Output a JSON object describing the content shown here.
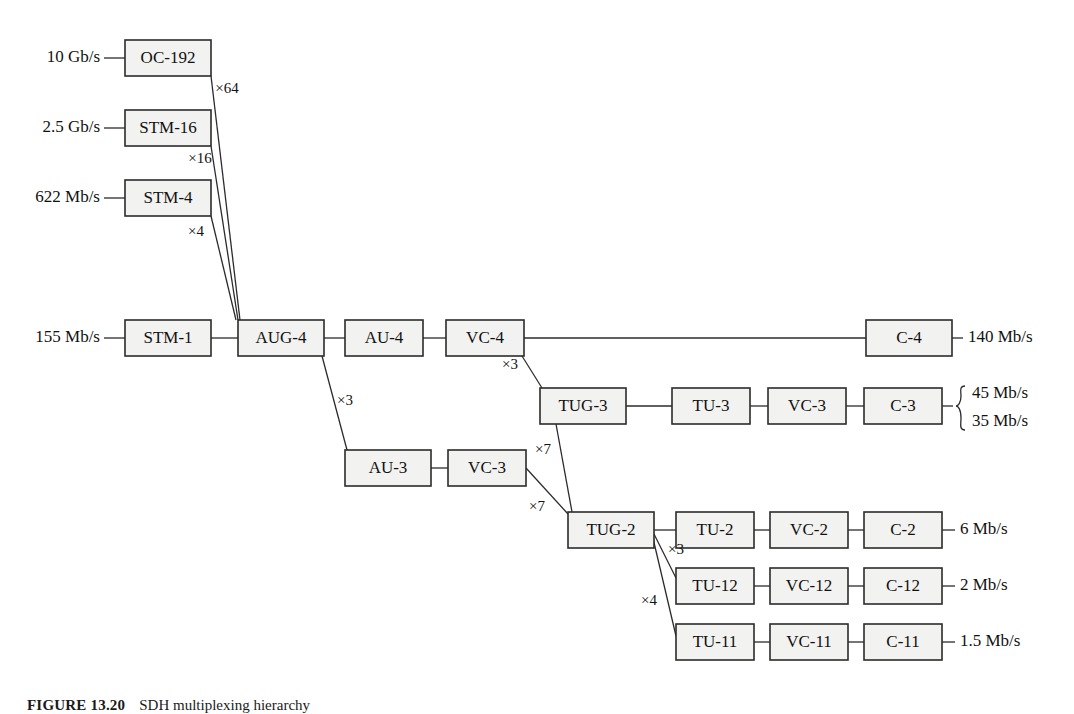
{
  "figure": {
    "caption_label": "FIGURE 13.20",
    "caption_text": "SDH multiplexing hierarchy",
    "box_fill": "#f2f2f0",
    "box_stroke": "#2b2b2b"
  },
  "nodes": {
    "oc192": {
      "label": "OC-192",
      "x": 125,
      "y": 40,
      "w": 86,
      "h": 36
    },
    "stm16": {
      "label": "STM-16",
      "x": 125,
      "y": 110,
      "w": 86,
      "h": 36
    },
    "stm4": {
      "label": "STM-4",
      "x": 125,
      "y": 180,
      "w": 86,
      "h": 36
    },
    "stm1": {
      "label": "STM-1",
      "x": 125,
      "y": 320,
      "w": 86,
      "h": 36
    },
    "aug4": {
      "label": "AUG-4",
      "x": 238,
      "y": 320,
      "w": 86,
      "h": 36
    },
    "au4": {
      "label": "AU-4",
      "x": 345,
      "y": 320,
      "w": 78,
      "h": 36
    },
    "vc4": {
      "label": "VC-4",
      "x": 446,
      "y": 320,
      "w": 78,
      "h": 36
    },
    "c4": {
      "label": "C-4",
      "x": 866,
      "y": 320,
      "w": 86,
      "h": 36
    },
    "tug3": {
      "label": "TUG-3",
      "x": 540,
      "y": 388,
      "w": 86,
      "h": 36
    },
    "tu3": {
      "label": "TU-3",
      "x": 672,
      "y": 388,
      "w": 78,
      "h": 36
    },
    "vc3r": {
      "label": "VC-3",
      "x": 768,
      "y": 388,
      "w": 78,
      "h": 36
    },
    "c3": {
      "label": "C-3",
      "x": 864,
      "y": 388,
      "w": 78,
      "h": 36
    },
    "au3": {
      "label": "AU-3",
      "x": 345,
      "y": 450,
      "w": 86,
      "h": 36
    },
    "vc3l": {
      "label": "VC-3",
      "x": 448,
      "y": 450,
      "w": 78,
      "h": 36
    },
    "tug2": {
      "label": "TUG-2",
      "x": 568,
      "y": 512,
      "w": 86,
      "h": 36
    },
    "tu2": {
      "label": "TU-2",
      "x": 676,
      "y": 512,
      "w": 78,
      "h": 36
    },
    "vc2": {
      "label": "VC-2",
      "x": 770,
      "y": 512,
      "w": 78,
      "h": 36
    },
    "c2": {
      "label": "C-2",
      "x": 864,
      "y": 512,
      "w": 78,
      "h": 36
    },
    "tu12": {
      "label": "TU-12",
      "x": 676,
      "y": 568,
      "w": 78,
      "h": 36
    },
    "vc12": {
      "label": "VC-12",
      "x": 770,
      "y": 568,
      "w": 78,
      "h": 36
    },
    "c12": {
      "label": "C-12",
      "x": 864,
      "y": 568,
      "w": 78,
      "h": 36
    },
    "tu11": {
      "label": "TU-11",
      "x": 676,
      "y": 624,
      "w": 78,
      "h": 36
    },
    "vc11": {
      "label": "VC-11",
      "x": 770,
      "y": 624,
      "w": 78,
      "h": 36
    },
    "c11": {
      "label": "C-11",
      "x": 864,
      "y": 624,
      "w": 78,
      "h": 36
    }
  },
  "input_rates": [
    {
      "text": "10 Gb/s",
      "x": 100,
      "y": 58,
      "dash_x1": 104,
      "dash_x2": 125
    },
    {
      "text": "2.5 Gb/s",
      "x": 100,
      "y": 128,
      "dash_x1": 104,
      "dash_x2": 125
    },
    {
      "text": "622 Mb/s",
      "x": 100,
      "y": 198,
      "dash_x1": 104,
      "dash_x2": 125
    },
    {
      "text": "155 Mb/s",
      "x": 100,
      "y": 338,
      "dash_x1": 104,
      "dash_x2": 125
    }
  ],
  "output_rates": [
    {
      "text": "140 Mb/s",
      "x": 968,
      "y": 338,
      "dash_x1": 952,
      "dash_x2": 963
    },
    {
      "text": "6 Mb/s",
      "x": 960,
      "y": 530,
      "dash_x1": 942,
      "dash_x2": 955
    },
    {
      "text": "2 Mb/s",
      "x": 960,
      "y": 586,
      "dash_x1": 942,
      "dash_x2": 955
    },
    {
      "text": "1.5 Mb/s",
      "x": 960,
      "y": 642,
      "dash_x1": 942,
      "dash_x2": 955
    }
  ],
  "braced_rates": {
    "top": "45 Mb/s",
    "bottom": "35 Mb/s",
    "dash_x1": 942,
    "dash_x2": 953,
    "brace_x": 958,
    "text_x": 972,
    "top_y": 394,
    "bottom_y": 422,
    "center_y": 406
  },
  "multipliers": [
    {
      "label": "×64",
      "x": 227,
      "y": 90
    },
    {
      "label": "×16",
      "x": 200,
      "y": 160
    },
    {
      "label": "×4",
      "x": 196,
      "y": 233
    },
    {
      "label": "×3",
      "x": 345,
      "y": 402
    },
    {
      "label": "×3",
      "x": 510,
      "y": 366
    },
    {
      "label": "×7",
      "x": 543,
      "y": 451
    },
    {
      "label": "×7",
      "x": 537,
      "y": 508
    },
    {
      "label": "×3",
      "x": 676,
      "y": 551
    },
    {
      "label": "×4",
      "x": 649,
      "y": 602
    }
  ],
  "links_horizontal": [
    {
      "x1": 211,
      "y1": 338,
      "x2": 238,
      "y2": 338
    },
    {
      "x1": 324,
      "y1": 338,
      "x2": 345,
      "y2": 338
    },
    {
      "x1": 423,
      "y1": 338,
      "x2": 446,
      "y2": 338
    },
    {
      "x1": 524,
      "y1": 338,
      "x2": 866,
      "y2": 338
    },
    {
      "x1": 626,
      "y1": 406,
      "x2": 672,
      "y2": 406
    },
    {
      "x1": 750,
      "y1": 406,
      "x2": 768,
      "y2": 406
    },
    {
      "x1": 846,
      "y1": 406,
      "x2": 864,
      "y2": 406
    },
    {
      "x1": 431,
      "y1": 468,
      "x2": 448,
      "y2": 468
    },
    {
      "x1": 654,
      "y1": 530,
      "x2": 676,
      "y2": 530
    },
    {
      "x1": 754,
      "y1": 530,
      "x2": 770,
      "y2": 530
    },
    {
      "x1": 848,
      "y1": 530,
      "x2": 864,
      "y2": 530
    },
    {
      "x1": 754,
      "y1": 586,
      "x2": 770,
      "y2": 586
    },
    {
      "x1": 848,
      "y1": 586,
      "x2": 864,
      "y2": 586
    },
    {
      "x1": 754,
      "y1": 642,
      "x2": 770,
      "y2": 642
    },
    {
      "x1": 848,
      "y1": 642,
      "x2": 864,
      "y2": 642
    }
  ],
  "links_fan": [
    {
      "name": "oc192-to-aug4",
      "x1": 211,
      "y1": 76,
      "x2": 240,
      "y2": 320
    },
    {
      "name": "stm16-to-aug4",
      "x1": 211,
      "y1": 146,
      "x2": 238,
      "y2": 320
    },
    {
      "name": "stm4-to-aug4",
      "x1": 211,
      "y1": 216,
      "x2": 236,
      "y2": 320
    },
    {
      "name": "aug4-to-au3",
      "x1": 322,
      "y1": 356,
      "x2": 347,
      "y2": 450
    },
    {
      "name": "vc4-to-tug3",
      "x1": 522,
      "y1": 356,
      "x2": 542,
      "y2": 388
    },
    {
      "name": "tug3-to-tug2",
      "x1": 556,
      "y1": 424,
      "x2": 572,
      "y2": 512
    },
    {
      "name": "vc3l-to-tug2",
      "x1": 526,
      "y1": 468,
      "x2": 568,
      "y2": 514
    },
    {
      "name": "tug2-to-tu12",
      "x1": 654,
      "y1": 534,
      "x2": 676,
      "y2": 578
    },
    {
      "name": "tug2-to-tu11",
      "x1": 652,
      "y1": 534,
      "x2": 676,
      "y2": 636
    }
  ]
}
